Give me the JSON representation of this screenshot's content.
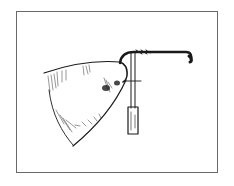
{
  "illustration": {
    "subject": "pen-and-ink sketch of a cone-shaped bell on a bent wire hook mounted in a tube handle",
    "ink_color": "#1a1a1a",
    "frame_color": "#6a6a6a",
    "background_color": "#ffffff"
  }
}
